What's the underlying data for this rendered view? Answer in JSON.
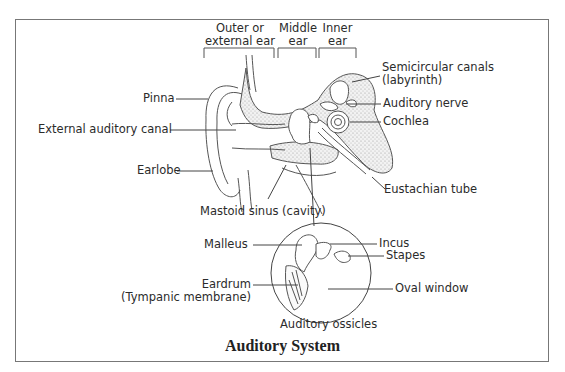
{
  "figure": {
    "title": "Auditory System"
  },
  "regions": [
    {
      "label_line1": "Outer or",
      "label_line2": "external ear"
    },
    {
      "label_line1": "Middle",
      "label_line2": "ear"
    },
    {
      "label_line1": "Inner",
      "label_line2": "ear"
    }
  ],
  "labels": {
    "pinna": "Pinna",
    "external_auditory_canal": "External auditory canal",
    "earlobe": "Earlobe",
    "semicircular_canals_line1": "Semicircular canals",
    "semicircular_canals_line2": "(labyrinth)",
    "auditory_nerve": "Auditory nerve",
    "cochlea": "Cochlea",
    "eustachian_tube": "Eustachian tube",
    "mastoid_sinus": "Mastoid sinus (cavity)",
    "malleus": "Malleus",
    "incus": "Incus",
    "stapes": "Stapes",
    "eardrum_line1": "Eardrum",
    "eardrum_line2": "(Tympanic membrane)",
    "oval_window": "Oval window",
    "auditory_ossicles": "Auditory ossicles"
  }
}
